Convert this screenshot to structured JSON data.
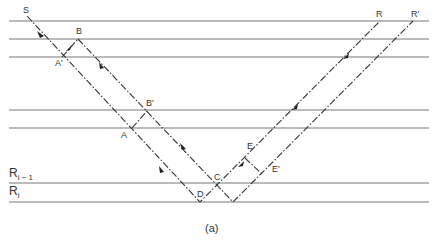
{
  "diagram": {
    "caption": "(a)",
    "layers": {
      "y_positions": [
        21,
        39,
        57,
        110,
        128,
        183,
        202
      ],
      "x_start": 9,
      "x_end": 429,
      "labels": [
        {
          "id": "R_i_minus_1",
          "base": "R",
          "sub": "i − 1"
        },
        {
          "id": "R_i",
          "base": "R",
          "sub": "i"
        }
      ]
    },
    "points": {
      "S": "S",
      "A": "A",
      "B": "B",
      "A_prime": "A'",
      "B_prime": "B'",
      "C": "C",
      "D": "D",
      "E": "E",
      "E_prime": "E'",
      "R": "R",
      "R_prime": "R'"
    },
    "colors": {
      "line": "#555555",
      "ray": "#333333"
    }
  }
}
